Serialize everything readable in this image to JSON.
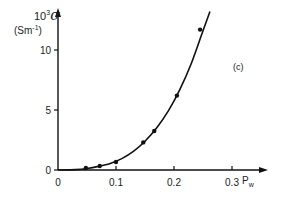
{
  "chart_data": {
    "type": "line",
    "title": "",
    "panel_label": "(c)",
    "xlabel": "P_w",
    "ylabel": "10^3 σ (S m^-1)",
    "ylabel_line1": "10",
    "ylabel_sup": "3",
    "ylabel_sigma": "σ",
    "ylabel_line2": "(Sm",
    "ylabel_line2_sup": "-1",
    "ylabel_line2_end": ")",
    "xlim": [
      0,
      0.35
    ],
    "ylim": [
      0,
      13
    ],
    "x_ticks": [
      "0",
      "0.1",
      "0.2",
      "0.3"
    ],
    "y_ticks": [
      "0",
      "5",
      "10"
    ],
    "grid": false,
    "series": [
      {
        "name": "measured",
        "style": "markers",
        "x": [
          0.048,
          0.072,
          0.1,
          0.147,
          0.166,
          0.205,
          0.245
        ],
        "y": [
          0.17,
          0.33,
          0.67,
          2.3,
          3.25,
          6.2,
          11.7
        ]
      },
      {
        "name": "fit",
        "style": "line",
        "x": [
          0.0,
          0.03,
          0.05,
          0.07,
          0.09,
          0.11,
          0.13,
          0.15,
          0.17,
          0.19,
          0.21,
          0.23,
          0.25,
          0.262
        ],
        "y": [
          0.0,
          0.03,
          0.12,
          0.3,
          0.55,
          0.95,
          1.55,
          2.4,
          3.5,
          4.9,
          6.7,
          8.9,
          11.6,
          13.2
        ]
      }
    ]
  }
}
